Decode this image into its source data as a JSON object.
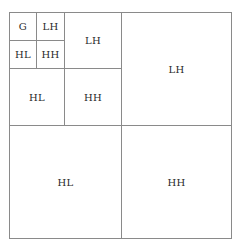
{
  "diagram": {
    "type": "wavelet-decomposition-3-level",
    "colors": {
      "line": "#8a8a8a",
      "text": "#2a2a2a",
      "background": "#ffffff"
    },
    "cells": [
      {
        "id": "g",
        "label": "G",
        "level": 3,
        "x": 9,
        "y": 12,
        "w": 28,
        "h": 29
      },
      {
        "id": "lh3",
        "label": "LH",
        "level": 3,
        "x": 36,
        "y": 12,
        "w": 29,
        "h": 29
      },
      {
        "id": "hl3",
        "label": "HL",
        "level": 3,
        "x": 9,
        "y": 40,
        "w": 28,
        "h": 29
      },
      {
        "id": "hh3",
        "label": "HH",
        "level": 3,
        "x": 36,
        "y": 40,
        "w": 29,
        "h": 29
      },
      {
        "id": "lh2",
        "label": "LH",
        "level": 2,
        "x": 64,
        "y": 12,
        "w": 58,
        "h": 57
      },
      {
        "id": "hl2",
        "label": "HL",
        "level": 2,
        "x": 9,
        "y": 68,
        "w": 56,
        "h": 58
      },
      {
        "id": "hh2",
        "label": "HH",
        "level": 2,
        "x": 64,
        "y": 68,
        "w": 58,
        "h": 58
      },
      {
        "id": "lh1",
        "label": "LH",
        "level": 1,
        "x": 121,
        "y": 12,
        "w": 111,
        "h": 114
      },
      {
        "id": "hl1",
        "label": "HL",
        "level": 1,
        "x": 9,
        "y": 125,
        "w": 113,
        "h": 114
      },
      {
        "id": "hh1",
        "label": "HH",
        "level": 1,
        "x": 121,
        "y": 125,
        "w": 111,
        "h": 114
      }
    ]
  }
}
